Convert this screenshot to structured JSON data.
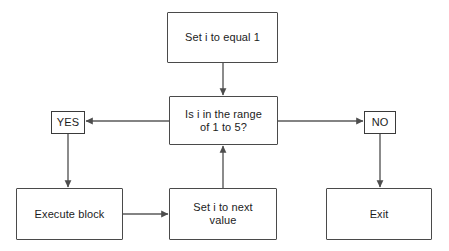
{
  "diagram": {
    "background_color": "#ffffff",
    "node_border_color": "#4a4a4a",
    "edge_color": "#5a5a5a",
    "text_color": "#1c1c1c",
    "nodes": [
      {
        "id": "init",
        "label": "Set i to equal 1",
        "shape": "rectangle",
        "x": 167,
        "y": 12,
        "w": 111,
        "h": 51
      },
      {
        "id": "condition",
        "label": "Is i in the range\nof 1 to 5?",
        "shape": "rectangle",
        "x": 169,
        "y": 96,
        "w": 109,
        "h": 49
      },
      {
        "id": "yes",
        "label": "YES",
        "shape": "rectangle",
        "x": 51,
        "y": 111,
        "w": 34,
        "h": 23
      },
      {
        "id": "no",
        "label": "NO",
        "shape": "rectangle",
        "x": 364,
        "y": 111,
        "w": 32,
        "h": 23
      },
      {
        "id": "execute",
        "label": "Execute block",
        "shape": "rectangle",
        "x": 16,
        "y": 188,
        "w": 107,
        "h": 52
      },
      {
        "id": "increment",
        "label": "Set i to next\nvalue",
        "shape": "rectangle",
        "x": 169,
        "y": 188,
        "w": 108,
        "h": 52
      },
      {
        "id": "exit",
        "label": "Exit",
        "shape": "rectangle",
        "x": 326,
        "y": 188,
        "w": 106,
        "h": 52
      }
    ],
    "edges": [
      {
        "id": "init-to-condition",
        "from": "init",
        "to": "condition",
        "direction": "down",
        "arrowhead": true
      },
      {
        "id": "condition-to-yes",
        "from": "condition",
        "to": "yes",
        "direction": "left",
        "arrowhead": true
      },
      {
        "id": "condition-to-no",
        "from": "condition",
        "to": "no",
        "direction": "right",
        "arrowhead": true
      },
      {
        "id": "yes-to-execute",
        "from": "yes",
        "to": "execute",
        "direction": "down",
        "arrowhead": true
      },
      {
        "id": "no-to-exit",
        "from": "no",
        "to": "exit",
        "direction": "down",
        "arrowhead": true
      },
      {
        "id": "execute-to-increment",
        "from": "execute",
        "to": "increment",
        "direction": "right",
        "arrowhead": true
      },
      {
        "id": "increment-to-condition",
        "from": "increment",
        "to": "condition",
        "direction": "up",
        "arrowhead": true
      }
    ]
  }
}
